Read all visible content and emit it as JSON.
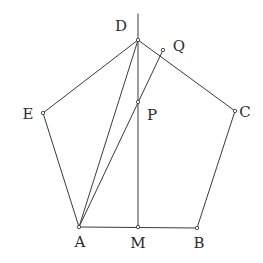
{
  "figure": {
    "background_color": "#ffffff",
    "stroke_color": "#3a3a3a",
    "label_color": "#2b2b2b",
    "width": 263,
    "height": 263
  },
  "points": {
    "A": {
      "label": "A",
      "x": 79,
      "y": 227,
      "label_x": 80,
      "label_y": 242,
      "dot": true
    },
    "B": {
      "label": "B",
      "x": 197,
      "y": 228,
      "label_x": 199,
      "label_y": 243,
      "dot": true
    },
    "C": {
      "label": "C",
      "x": 235,
      "y": 111,
      "label_x": 245,
      "label_y": 112,
      "dot": true
    },
    "D": {
      "label": "D",
      "x": 138,
      "y": 40,
      "label_x": 121,
      "label_y": 26,
      "dot": true
    },
    "E": {
      "label": "E",
      "x": 43,
      "y": 113,
      "label_x": 28,
      "label_y": 114,
      "dot": true
    },
    "M": {
      "label": "M",
      "x": 138,
      "y": 227,
      "label_x": 138,
      "label_y": 243,
      "dot": true
    },
    "P": {
      "label": "P",
      "x": 138,
      "y": 102,
      "label_x": 152,
      "label_y": 115,
      "dot": true
    },
    "Q": {
      "label": "Q",
      "x": 163,
      "y": 50,
      "label_x": 179,
      "label_y": 46,
      "dot": true
    }
  },
  "segments": [
    {
      "name": "side-AB",
      "from": "A",
      "to": "B",
      "kind": "edge"
    },
    {
      "name": "side-BC",
      "from": "B",
      "to": "C",
      "kind": "edge"
    },
    {
      "name": "side-CD",
      "from": "C",
      "to": "D",
      "kind": "edge"
    },
    {
      "name": "side-DE",
      "from": "D",
      "to": "E",
      "kind": "edge"
    },
    {
      "name": "side-EA",
      "from": "E",
      "to": "A",
      "kind": "edge"
    },
    {
      "name": "cevian-AD",
      "from": "A",
      "to": "D",
      "kind": "cevian"
    },
    {
      "name": "cevian-AQ",
      "from": "A",
      "to": "Q",
      "kind": "cevian"
    }
  ],
  "axis": {
    "name": "vertical-axis-DM",
    "x": 138,
    "y_top": 14,
    "y_bottom": 227
  },
  "chart_data": {
    "type": "scatter",
    "xlabel": "",
    "ylabel": "",
    "x": [
      79,
      197,
      235,
      138,
      43,
      138,
      138,
      163
    ],
    "y": [
      227,
      228,
      111,
      40,
      113,
      227,
      102,
      50
    ],
    "labels": [
      "A",
      "B",
      "C",
      "D",
      "E",
      "M",
      "P",
      "Q"
    ],
    "polyline": [
      "A",
      "B",
      "C",
      "D",
      "E",
      "A"
    ],
    "extra_lines": [
      [
        "A",
        "D"
      ],
      [
        "A",
        "Q"
      ],
      [
        "D-axis-top",
        "M"
      ]
    ],
    "grid": false,
    "legend": "none"
  }
}
